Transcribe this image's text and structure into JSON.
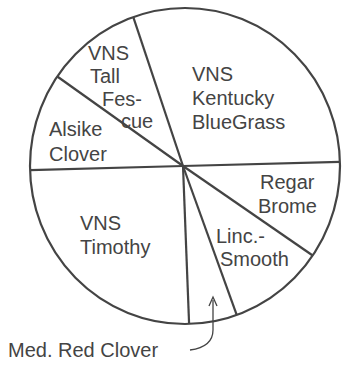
{
  "chart_data": {
    "type": "pie",
    "title": "",
    "slices": [
      {
        "label": "VNS Kentucky BlueGrass",
        "value": 30
      },
      {
        "label": "VNS Tall Fescue",
        "value": 10
      },
      {
        "label": "Alsike Clover",
        "value": 10
      },
      {
        "label": "VNS Timothy",
        "value": 25
      },
      {
        "label": "Med. Red Clover",
        "value": 5
      },
      {
        "label": "Linc.-Smooth",
        "value": 10
      },
      {
        "label": "Regar Brome",
        "value": 10
      }
    ],
    "start_angle_deg": 1.5,
    "direction": "counter-clockwise",
    "legend": "none",
    "fill_color": "#ffffff",
    "line_color": "#444444"
  },
  "labels": {
    "kentucky": [
      "VNS",
      "Kentucky",
      "BlueGrass"
    ],
    "fescue": [
      "VNS",
      "Tall",
      "Fes-",
      "cue"
    ],
    "alsike": [
      "Alsike",
      "Clover"
    ],
    "timothy": [
      "VNS",
      "Timothy"
    ],
    "regar": [
      "Regar",
      "Brome"
    ],
    "linc": [
      "Linc.-",
      "Smooth"
    ],
    "redclover": "Med. Red Clover"
  }
}
